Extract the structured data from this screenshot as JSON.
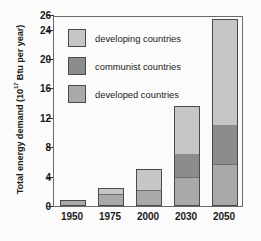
{
  "chart_data": {
    "type": "bar",
    "stacked": true,
    "title": "",
    "xlabel": "",
    "ylabel": "Total energy demand (10¹⁷ Btu per year)",
    "ylabel_prefix": "Total energy demand (10",
    "ylabel_exponent": "17",
    "ylabel_suffix": " Btu per year)",
    "categories": [
      "1950",
      "1975",
      "2000",
      "2030",
      "2050"
    ],
    "ylim": [
      0,
      26
    ],
    "yticks": [
      0,
      4,
      8,
      12,
      16,
      20,
      24,
      26
    ],
    "ytick_labels": [
      "0",
      "4",
      "8",
      "12",
      "16",
      "20",
      "24",
      "26"
    ],
    "grid": false,
    "legend_position": "upper-left-inside",
    "series": [
      {
        "name": "developed countries",
        "key": "developed",
        "color": "#a9a9a9",
        "values": [
          0.8,
          1.7,
          2.1,
          3.8,
          5.5
        ]
      },
      {
        "name": "communist countries",
        "key": "communist",
        "color": "#8c8c8c",
        "values": [
          0.0,
          0.0,
          0.0,
          3.2,
          5.5
        ]
      },
      {
        "name": "developing countries",
        "key": "developing",
        "color": "#c6c6c6",
        "values": [
          0.0,
          0.7,
          2.9,
          6.6,
          14.5
        ]
      }
    ],
    "totals": [
      0.8,
      2.4,
      5.0,
      13.6,
      25.5
    ]
  },
  "legend": {
    "items": [
      {
        "label": "developing countries",
        "key": "developing"
      },
      {
        "label": "communist countries",
        "key": "communist"
      },
      {
        "label": "developed countries",
        "key": "developed"
      }
    ]
  },
  "colors": {
    "developing": "#c6c6c6",
    "communist": "#8c8c8c",
    "developed": "#a9a9a9",
    "axis": "#333333",
    "text": "#1a1a1a",
    "background": "#fbfbfb"
  }
}
